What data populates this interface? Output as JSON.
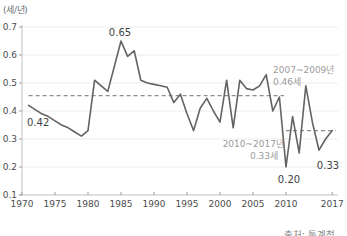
{
  "chart_data": {
    "type": "line",
    "title": "",
    "xlabel": "",
    "ylabel": "(세/년)",
    "unit_label": "(세/년)",
    "source": "출처: 통계청",
    "ylim": [
      0.1,
      0.7
    ],
    "xlim": [
      1970,
      2018
    ],
    "grid": true,
    "legend_position": "none",
    "y_ticks": [
      0.7,
      0.6,
      0.5,
      0.4,
      0.3,
      0.2,
      0.1
    ],
    "x_ticks": [
      1970,
      1975,
      1980,
      1985,
      1990,
      1995,
      2000,
      2005,
      2010,
      2017
    ],
    "x": [
      1971,
      1972,
      1973,
      1974,
      1975,
      1976,
      1977,
      1978,
      1979,
      1980,
      1981,
      1982,
      1983,
      1984,
      1985,
      1986,
      1987,
      1988,
      1989,
      1990,
      1991,
      1992,
      1993,
      1994,
      1995,
      1996,
      1997,
      1998,
      1999,
      2000,
      2001,
      2002,
      2003,
      2004,
      2005,
      2006,
      2007,
      2008,
      2009,
      2010,
      2011,
      2012,
      2013,
      2014,
      2015,
      2016,
      2017
    ],
    "values": [
      0.42,
      0.405,
      0.39,
      0.38,
      0.365,
      0.35,
      0.34,
      0.325,
      0.31,
      0.33,
      0.51,
      0.49,
      0.47,
      0.56,
      0.65,
      0.595,
      0.615,
      0.51,
      0.5,
      0.495,
      0.49,
      0.485,
      0.43,
      0.46,
      0.39,
      0.33,
      0.41,
      0.445,
      0.4,
      0.36,
      0.51,
      0.34,
      0.51,
      0.48,
      0.475,
      0.49,
      0.53,
      0.4,
      0.45,
      0.2,
      0.38,
      0.25,
      0.49,
      0.36,
      0.26,
      0.3,
      0.33
    ],
    "point_labels": [
      {
        "year": 1971,
        "label": "0.42"
      },
      {
        "year": 1985,
        "label": "0.65"
      },
      {
        "year": 2010,
        "label": "0.20"
      },
      {
        "year": 2017,
        "label": "0.33"
      }
    ],
    "reference_lines": [
      {
        "period_label": "2007~2009년",
        "value_label": "0.46세",
        "value": 0.455,
        "span": [
          1971,
          2009.7
        ]
      },
      {
        "period_label": "2010~2017년",
        "value_label": "0.33세",
        "value": 0.33,
        "span": [
          2010,
          2017.5
        ]
      }
    ],
    "colors": {
      "line": "#636363",
      "reference_dash": "#8c8c8c",
      "axis": "#c2c2c2",
      "grid": "#ececec",
      "tick_mark": "#9c9c9c",
      "value_label": "#3f3f3f",
      "annotation": "#9b9b9b",
      "background": "#ffffff"
    }
  }
}
